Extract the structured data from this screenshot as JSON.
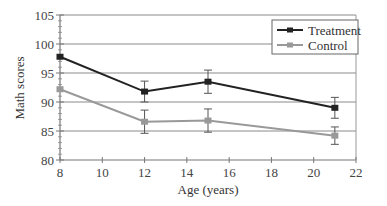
{
  "chart_data": {
    "type": "line",
    "title": "",
    "xlabel": "Age (years)",
    "ylabel": "Math scores",
    "xlim": [
      8,
      22
    ],
    "ylim": [
      80,
      105
    ],
    "xticks": [
      8,
      10,
      12,
      14,
      16,
      18,
      20,
      22
    ],
    "yticks": [
      80,
      85,
      90,
      95,
      100,
      105
    ],
    "grid": "horizontal",
    "legend_position": "upper right",
    "x": [
      8,
      12,
      15,
      21
    ],
    "series": [
      {
        "name": "Treatment",
        "color": "#222222",
        "values": [
          97.8,
          91.8,
          93.5,
          89.0
        ],
        "error": [
          0.0,
          1.8,
          2.0,
          1.8
        ]
      },
      {
        "name": "Control",
        "color": "#999999",
        "values": [
          92.2,
          86.6,
          86.8,
          84.2
        ],
        "error": [
          0.0,
          2.0,
          2.0,
          1.5
        ]
      }
    ]
  }
}
